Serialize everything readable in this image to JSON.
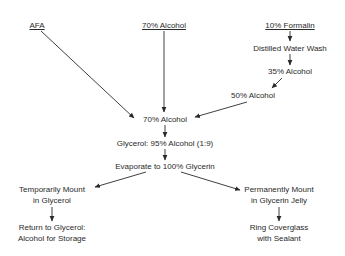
{
  "diagram": {
    "type": "flowchart",
    "nodes": [
      {
        "id": "afa",
        "lines": [
          "AFA"
        ],
        "underlined": true
      },
      {
        "id": "alcohol70_top",
        "lines": [
          "70% Alcohol"
        ],
        "underlined": true
      },
      {
        "id": "formalin10",
        "lines": [
          "10% Formalin"
        ],
        "underlined": true
      },
      {
        "id": "distilled",
        "lines": [
          "Distilled Water Wash"
        ]
      },
      {
        "id": "alcohol35",
        "lines": [
          "35% Alcohol"
        ]
      },
      {
        "id": "alcohol50",
        "lines": [
          "50% Alcohol"
        ]
      },
      {
        "id": "alcohol70_mid",
        "lines": [
          "70% Alcohol"
        ]
      },
      {
        "id": "glycerol_mix",
        "lines": [
          "Glycerol: 95% Alcohol (1:9)"
        ]
      },
      {
        "id": "evaporate",
        "lines": [
          "Evaporate to 100% Glycerin"
        ]
      },
      {
        "id": "temp_mount",
        "lines": [
          "Temporarily Mount",
          "in Glycerol"
        ]
      },
      {
        "id": "return_storage",
        "lines": [
          "Return to Glycerol:",
          "Alcohol for Storage"
        ]
      },
      {
        "id": "perm_mount",
        "lines": [
          "Permanently Mount",
          "in Glycerin Jelly"
        ]
      },
      {
        "id": "ring_cover",
        "lines": [
          "Ring Coverglass",
          "with Sealant"
        ]
      }
    ],
    "edges": [
      {
        "from": "afa",
        "to": "alcohol70_mid"
      },
      {
        "from": "alcohol70_top",
        "to": "alcohol70_mid"
      },
      {
        "from": "formalin10",
        "to": "distilled"
      },
      {
        "from": "distilled",
        "to": "alcohol35"
      },
      {
        "from": "alcohol35",
        "to": "alcohol50"
      },
      {
        "from": "alcohol50",
        "to": "alcohol70_mid"
      },
      {
        "from": "alcohol70_mid",
        "to": "glycerol_mix"
      },
      {
        "from": "glycerol_mix",
        "to": "evaporate"
      },
      {
        "from": "evaporate",
        "to": "temp_mount"
      },
      {
        "from": "evaporate",
        "to": "perm_mount"
      },
      {
        "from": "temp_mount",
        "to": "return_storage"
      },
      {
        "from": "perm_mount",
        "to": "ring_cover"
      }
    ]
  }
}
